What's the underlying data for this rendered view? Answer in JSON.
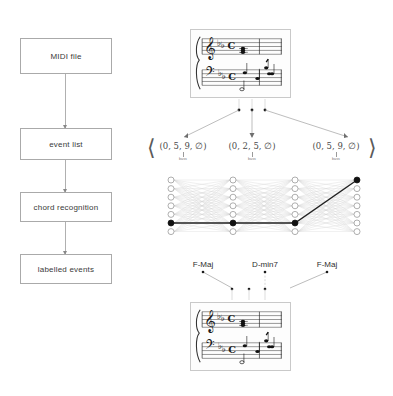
{
  "figure": {
    "background": "#ffffff",
    "line_color": "#9a9a9a",
    "node_fill_empty": "#ffffff",
    "node_fill_active": "#111111",
    "path_color": "#222222"
  },
  "pipeline": {
    "title": "chord recognition pipeline",
    "steps": [
      {
        "label": "MIDI file"
      },
      {
        "label": "event list"
      },
      {
        "label": "chord recognition"
      },
      {
        "label": "labelled events"
      }
    ],
    "arrow_count": 3
  },
  "score_top": {
    "name": "input-score",
    "clefs": [
      "treble",
      "bass"
    ],
    "key_signature": "two flats",
    "time_signature": "common time",
    "measures": 1
  },
  "score_bottom": {
    "name": "labelled-score",
    "clefs": [
      "treble",
      "bass"
    ],
    "key_signature": "two flats",
    "time_signature": "common time",
    "measures": 1
  },
  "tuples": {
    "open_bracket": "⟨",
    "close_bracket": "⟩",
    "outer_open": "⟨",
    "outer_close": "⟩",
    "sublabel": "bass",
    "items": [
      {
        "text": "(0, 5, 9, ∅)",
        "pre": "(0, ",
        "strong": "5",
        "post": ", 9, ∅)"
      },
      {
        "text": "(0, 2, 5, ∅)",
        "pre": "(0, ",
        "strong": "2",
        "post": ", 5, ∅)"
      },
      {
        "text": "(0, 5, 9, ∅)",
        "pre": "(0, ",
        "strong": "5",
        "post": ", 9, ∅)"
      }
    ]
  },
  "trellis": {
    "name": "hmm-trellis",
    "columns": 4,
    "rows": 7,
    "active_nodes": [
      {
        "column": 0,
        "row": 5
      },
      {
        "column": 1,
        "row": 5
      },
      {
        "column": 2,
        "row": 5
      },
      {
        "column": 3,
        "row": 0
      }
    ],
    "viterbi_path": [
      {
        "column": 0,
        "row": 5
      },
      {
        "column": 1,
        "row": 5
      },
      {
        "column": 2,
        "row": 5
      },
      {
        "column": 3,
        "row": 0
      }
    ]
  },
  "chords": {
    "items": [
      {
        "label": "F-Maj"
      },
      {
        "label": "D-min7"
      },
      {
        "label": "F-Maj"
      }
    ]
  }
}
